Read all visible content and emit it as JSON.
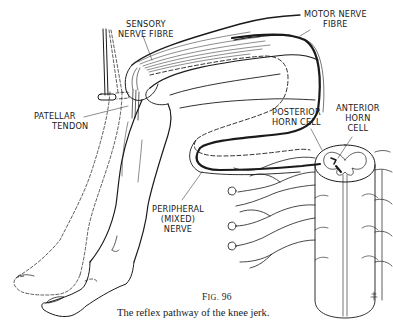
{
  "figure": {
    "title": "The reflex pathway of the knee jerk",
    "labels": {
      "sensory_nerve_fibre": [
        "SENSORY",
        "NERVE FIBRE"
      ],
      "motor_nerve_fibre": [
        "MOTOR NERVE",
        "FIBRE"
      ],
      "patellar_tendon": [
        "PATELLAR",
        "TENDON"
      ],
      "posterior_horn_cell": [
        "POSTERIOR",
        "HORN CELL"
      ],
      "anterior_horn_cell": [
        "ANTERIOR",
        "HORN",
        "CELL"
      ],
      "peripheral_mixed_nerve": [
        "PERIPHERAL",
        "(MIXED)",
        "NERVE"
      ]
    },
    "figure_number_prefix": "F",
    "figure_number_smallcaps": "IG.",
    "figure_number": "96",
    "caption": "The reflex pathway of the knee jerk.",
    "colors": {
      "ink": "#1a1a1a",
      "background": "#ffffff"
    }
  }
}
